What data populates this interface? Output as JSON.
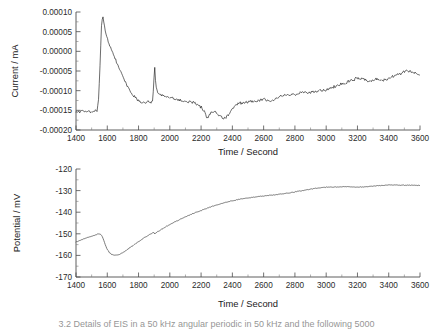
{
  "figure": {
    "background": "#ffffff",
    "trace_color_current": "#101010",
    "trace_color_potential": "#555555",
    "axis_color": "#4d4d4d"
  },
  "caption": {
    "text": "3.2 Details of EIS in a 50 kHz angular periodic in 50 kHz and the following 5000"
  },
  "chart_data": [
    {
      "type": "line",
      "id": "current-vs-time",
      "title": "",
      "xlabel": "Time / Second",
      "ylabel": "Current / mA",
      "xlim": [
        1400,
        3600
      ],
      "ylim": [
        -0.0002,
        0.0001
      ],
      "xticks": [
        1400,
        1600,
        1800,
        2000,
        2200,
        2400,
        2600,
        2800,
        3000,
        3200,
        3400,
        3600
      ],
      "xticklabels": [
        "1400",
        "1600",
        "1800",
        "2000",
        "2200",
        "2400",
        "2600",
        "2800",
        "3000",
        "3200",
        "3400",
        "3600"
      ],
      "yticks": [
        0.0001,
        5e-05,
        0.0,
        -5e-05,
        -0.0001,
        -0.00015,
        -0.0002
      ],
      "yticklabels": [
        "0.00010",
        "0.00005",
        "0.00000",
        "-0.00005",
        "-0.00010",
        "-0.00015",
        "-0.00020"
      ],
      "minor_ticks": true,
      "grid": false,
      "legend": false,
      "noise_amplitude": 4.5e-06,
      "x": [
        1400,
        1420,
        1440,
        1460,
        1480,
        1500,
        1520,
        1535,
        1545,
        1555,
        1562,
        1570,
        1578,
        1590,
        1605,
        1620,
        1640,
        1660,
        1680,
        1700,
        1720,
        1740,
        1760,
        1780,
        1800,
        1820,
        1840,
        1860,
        1880,
        1890,
        1898,
        1903,
        1910,
        1920,
        1940,
        1960,
        1980,
        2000,
        2040,
        2080,
        2120,
        2160,
        2200,
        2220,
        2240,
        2260,
        2280,
        2300,
        2320,
        2340,
        2360,
        2380,
        2400,
        2440,
        2480,
        2520,
        2560,
        2600,
        2640,
        2680,
        2720,
        2760,
        2800,
        2840,
        2880,
        2920,
        2960,
        3000,
        3040,
        3080,
        3120,
        3160,
        3200,
        3240,
        3280,
        3320,
        3360,
        3400,
        3440,
        3480,
        3520,
        3560,
        3600
      ],
      "y": [
        -0.000152,
        -0.000153,
        -0.000151,
        -0.000154,
        -0.000152,
        -0.000153,
        -0.000151,
        -0.00015,
        -0.00012,
        -2e-05,
        6e-05,
        9.2e-05,
        7.5e-05,
        4.8e-05,
        2.8e-05,
        1.2e-05,
        -8e-06,
        -2.8e-05,
        -4.8e-05,
        -6.5e-05,
        -8.2e-05,
        -9.6e-05,
        -0.000108,
        -0.000118,
        -0.000126,
        -0.00013,
        -0.000131,
        -0.000129,
        -0.000131,
        -0.000128,
        -7.5e-05,
        -4e-05,
        -8e-05,
        -0.000104,
        -0.00011,
        -0.000113,
        -0.000116,
        -0.000118,
        -0.000122,
        -0.000126,
        -0.000128,
        -0.000132,
        -0.000141,
        -0.000152,
        -0.00017,
        -0.000158,
        -0.000152,
        -0.000158,
        -0.000164,
        -0.00017,
        -0.000168,
        -0.000158,
        -0.000146,
        -0.000132,
        -0.00013,
        -0.000128,
        -0.000126,
        -0.000122,
        -0.000128,
        -0.000118,
        -0.000112,
        -0.00011,
        -0.00011,
        -0.000106,
        -0.000105,
        -0.000104,
        -0.0001,
        -9.8e-05,
        -9.2e-05,
        -8.6e-05,
        -8e-05,
        -7.4e-05,
        -6.8e-05,
        -7.2e-05,
        -7.6e-05,
        -7e-05,
        -7.4e-05,
        -6.8e-05,
        -6.2e-05,
        -5.6e-05,
        -5e-05,
        -5.4e-05,
        -5.8e-05
      ]
    },
    {
      "type": "line",
      "id": "potential-vs-time",
      "title": "",
      "xlabel": "Time / Second",
      "ylabel": "Potential / mV",
      "xlim": [
        1400,
        3600
      ],
      "ylim": [
        -170,
        -120
      ],
      "xticks": [
        1400,
        1600,
        1800,
        2000,
        2200,
        2400,
        2600,
        2800,
        3000,
        3200,
        3400,
        3600
      ],
      "xticklabels": [
        "1400",
        "1600",
        "1800",
        "2000",
        "2200",
        "2400",
        "2600",
        "2800",
        "3000",
        "3200",
        "3400",
        "3600"
      ],
      "yticks": [
        -120,
        -130,
        -140,
        -150,
        -160,
        -170
      ],
      "yticklabels": [
        "-120",
        "-130",
        "-140",
        "-150",
        "-160",
        "-170"
      ],
      "minor_ticks": true,
      "grid": false,
      "legend": false,
      "noise_amplitude": 0.18,
      "x": [
        1400,
        1420,
        1440,
        1460,
        1480,
        1500,
        1520,
        1540,
        1550,
        1560,
        1570,
        1580,
        1590,
        1600,
        1615,
        1630,
        1645,
        1660,
        1675,
        1690,
        1710,
        1730,
        1750,
        1780,
        1810,
        1840,
        1870,
        1890,
        1898,
        1903,
        1912,
        1925,
        1950,
        1980,
        2010,
        2040,
        2080,
        2120,
        2160,
        2200,
        2240,
        2280,
        2320,
        2360,
        2400,
        2440,
        2480,
        2520,
        2560,
        2600,
        2640,
        2680,
        2720,
        2760,
        2800,
        2840,
        2880,
        2920,
        2960,
        3000,
        3040,
        3080,
        3120,
        3160,
        3200,
        3240,
        3280,
        3320,
        3360,
        3400,
        3440,
        3480,
        3520,
        3560,
        3600
      ],
      "y": [
        -153.8,
        -153.2,
        -152.6,
        -152.1,
        -151.6,
        -151.1,
        -150.6,
        -150.1,
        -150.0,
        -150.4,
        -151.6,
        -153.6,
        -155.6,
        -157.2,
        -158.8,
        -159.6,
        -159.9,
        -159.9,
        -159.6,
        -159.1,
        -158.2,
        -157.2,
        -156.1,
        -154.6,
        -153.1,
        -151.7,
        -150.4,
        -149.6,
        -149.3,
        -150.1,
        -149.5,
        -148.9,
        -147.8,
        -146.5,
        -145.3,
        -144.2,
        -142.8,
        -141.5,
        -140.3,
        -139.2,
        -138.1,
        -137.1,
        -136.2,
        -135.4,
        -134.7,
        -134.1,
        -133.6,
        -133.2,
        -132.8,
        -132.5,
        -132.2,
        -131.9,
        -131.5,
        -131.1,
        -130.6,
        -130.1,
        -129.6,
        -129.1,
        -128.7,
        -128.4,
        -128.3,
        -128.3,
        -128.2,
        -128.3,
        -128.4,
        -128.3,
        -128.1,
        -127.8,
        -127.6,
        -127.4,
        -127.4,
        -127.5,
        -127.5,
        -127.5,
        -127.6
      ]
    }
  ]
}
